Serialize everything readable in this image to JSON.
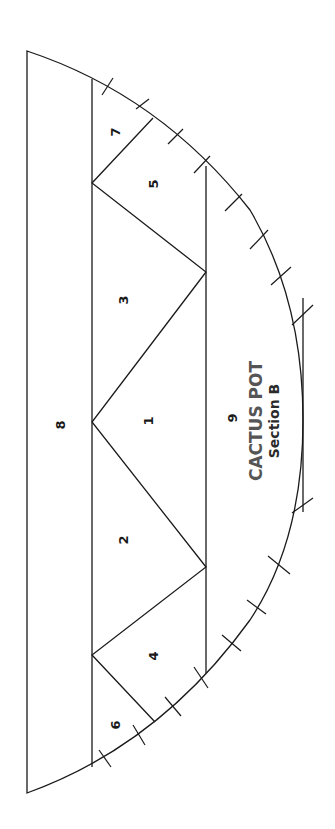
{
  "pattern": {
    "title": "CACTUS POT",
    "subtitle": "Section B",
    "pieces": [
      {
        "id": "piece-1",
        "label": "1"
      },
      {
        "id": "piece-2",
        "label": "2"
      },
      {
        "id": "piece-3",
        "label": "3"
      },
      {
        "id": "piece-4",
        "label": "4"
      },
      {
        "id": "piece-5",
        "label": "5"
      },
      {
        "id": "piece-6",
        "label": "6"
      },
      {
        "id": "piece-7",
        "label": "7"
      },
      {
        "id": "piece-8",
        "label": "8"
      },
      {
        "id": "piece-9",
        "label": "9"
      }
    ],
    "line_color": "#1a1a1a",
    "title_color": "#555555"
  }
}
